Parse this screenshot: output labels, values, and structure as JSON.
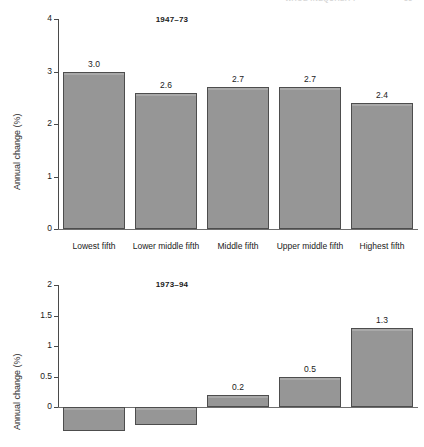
{
  "page": {
    "running_head": "WAGE INEQUALITY",
    "page_number": "33"
  },
  "figure": {
    "y_axis_label": "Annual change (%)",
    "categories": [
      "Lowest fifth",
      "Lower middle fifth",
      "Middle fifth",
      "Upper middle fifth",
      "Highest fifth"
    ],
    "bar_color": "#969696",
    "bar_edge_color": "#4d4d4d"
  },
  "chart_data": [
    {
      "type": "bar",
      "title": "1947–73",
      "categories": [
        "Lowest fifth",
        "Lower middle fifth",
        "Middle fifth",
        "Upper middle fifth",
        "Highest fifth"
      ],
      "values": [
        3.0,
        2.6,
        2.7,
        2.7,
        2.4
      ],
      "value_labels": [
        "3.0",
        "2.6",
        "2.7",
        "2.7",
        "2.4"
      ],
      "xlabel": "",
      "ylabel": "Annual change (%)",
      "ylim": [
        0,
        4
      ],
      "yticks": [
        0,
        1,
        2,
        3,
        4
      ],
      "ytick_labels": [
        "0",
        "1",
        "2",
        "3",
        "4"
      ],
      "grid": false,
      "legend": "none"
    },
    {
      "type": "bar",
      "title": "1973–94",
      "categories": [
        "Lowest fifth",
        "Lower middle fifth",
        "Middle fifth",
        "Upper middle fifth",
        "Highest fifth"
      ],
      "values": [
        -0.4,
        -0.3,
        0.2,
        0.5,
        1.3
      ],
      "value_labels": [
        "",
        "",
        "0.2",
        "0.5",
        "1.3"
      ],
      "xlabel": "",
      "ylabel": "Annual change (%)",
      "ylim": [
        -0.6,
        2
      ],
      "yticks": [
        0,
        0.5,
        1,
        1.5,
        2
      ],
      "ytick_labels": [
        "0",
        "0.5",
        "1",
        "1.5",
        "2"
      ],
      "grid": false,
      "legend": "none",
      "note": "lowest and lower middle fifth bars are negative and clipped by the bottom edge of the image"
    }
  ]
}
